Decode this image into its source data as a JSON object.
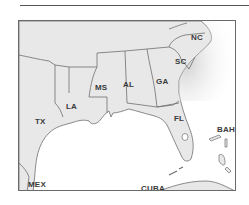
{
  "map": {
    "colors": {
      "land": "#e8e8e8",
      "water": "#ffffff",
      "border": "#6e6e6e",
      "label": "#3a3a3a",
      "frame": "#6a6a6a"
    },
    "labels": [
      {
        "id": "nc",
        "text": "NC",
        "x": 172,
        "y": 13
      },
      {
        "id": "sc",
        "text": "SC",
        "x": 156,
        "y": 37
      },
      {
        "id": "ga",
        "text": "GA",
        "x": 137,
        "y": 57
      },
      {
        "id": "al",
        "text": "AL",
        "x": 104,
        "y": 60
      },
      {
        "id": "ms",
        "text": "MS",
        "x": 76,
        "y": 63
      },
      {
        "id": "la",
        "text": "LA",
        "x": 47,
        "y": 82
      },
      {
        "id": "tx",
        "text": "TX",
        "x": 16,
        "y": 97
      },
      {
        "id": "fl",
        "text": "FL",
        "x": 155,
        "y": 94
      },
      {
        "id": "bah",
        "text": "BAH",
        "x": 198,
        "y": 105
      },
      {
        "id": "mex",
        "text": "MEX",
        "x": 9,
        "y": 160
      },
      {
        "id": "cuba",
        "text": "CUBA",
        "x": 122,
        "y": 164
      }
    ]
  }
}
